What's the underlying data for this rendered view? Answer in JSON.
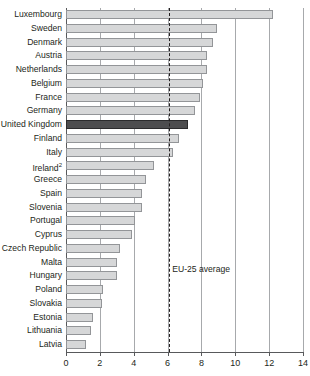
{
  "chart_data": {
    "type": "bar",
    "orientation": "horizontal",
    "title": "",
    "subtitle": "",
    "xlabel": "",
    "ylabel": "",
    "xlim": [
      0,
      14
    ],
    "xticks": [
      0,
      2,
      4,
      6,
      8,
      10,
      12,
      14
    ],
    "xtick_labels": [
      "0",
      "2",
      "4",
      "6",
      "8",
      "10",
      "12",
      "14"
    ],
    "grid": true,
    "legend": "none",
    "categories": [
      "Luxembourg",
      "Sweden",
      "Denmark",
      "Austria",
      "Netherlands",
      "Belgium",
      "France",
      "Germany",
      "United Kingdom",
      "Finland",
      "Italy",
      "Ireland",
      "Greece",
      "Spain",
      "Slovenia",
      "Portugal",
      "Cyprus",
      "Czech Republic",
      "Malta",
      "Hungary",
      "Poland",
      "Slovakia",
      "Estonia",
      "Lithuania",
      "Latvia"
    ],
    "category_footnotes": {
      "Ireland": "2"
    },
    "values": [
      12.2,
      8.9,
      8.7,
      8.3,
      8.3,
      8.1,
      7.9,
      7.6,
      7.2,
      6.7,
      6.3,
      5.2,
      4.7,
      4.5,
      4.5,
      4.1,
      3.9,
      3.2,
      3.0,
      3.0,
      2.2,
      2.1,
      1.6,
      1.5,
      1.2
    ],
    "highlight_category": "United Kingdom",
    "annotations": [
      {
        "name": "eu-25-average",
        "label": "EU-25 average",
        "value": 6.1,
        "style": "dashed-vertical"
      }
    ],
    "colors": {
      "bar_fill": "#d6d7d8",
      "bar_stroke": "#939598",
      "highlight_fill": "#4d4d4f",
      "highlight_stroke": "#2b2b2d",
      "gridline": "#a7a9ac",
      "axis": "#58595b",
      "text": "#231f20"
    }
  }
}
